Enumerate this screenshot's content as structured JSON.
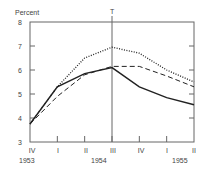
{
  "chart_data": {
    "type": "line",
    "title": "",
    "ylabel": "Percent",
    "xlabel": "",
    "ylim": [
      3,
      8
    ],
    "yticks": [
      3,
      4,
      5,
      6,
      7,
      8
    ],
    "categories": [
      "IV",
      "I",
      "II",
      "III",
      "IV",
      "I",
      "II"
    ],
    "year_labels": [
      {
        "label": "1953",
        "at_index": 0
      },
      {
        "label": "1954",
        "at_index": 2.5
      },
      {
        "label": "1955",
        "at_index": 5.5
      }
    ],
    "reference_line": {
      "label": "T",
      "at_index": 3
    },
    "grid": false,
    "legend": null,
    "series": [
      {
        "name": "solid",
        "style": "solid",
        "values": [
          3.75,
          5.3,
          5.85,
          6.1,
          5.3,
          4.85,
          4.55
        ]
      },
      {
        "name": "dashed",
        "style": "dashed",
        "values": [
          3.75,
          4.9,
          5.8,
          6.15,
          6.15,
          5.75,
          5.3
        ]
      },
      {
        "name": "dotted",
        "style": "dotted",
        "values": [
          3.75,
          5.3,
          6.5,
          6.95,
          6.7,
          6.0,
          5.5
        ]
      }
    ]
  },
  "labels": {
    "ylabel": "Percent",
    "y": [
      "8",
      "7",
      "6",
      "5",
      "4",
      "3"
    ],
    "x": [
      "IV",
      "I",
      "II",
      "III",
      "IV",
      "I",
      "II"
    ],
    "years": [
      "1953",
      "1954",
      "1955"
    ],
    "ref": "T"
  },
  "colors": {
    "line": "#222222",
    "axis": "#555555"
  }
}
